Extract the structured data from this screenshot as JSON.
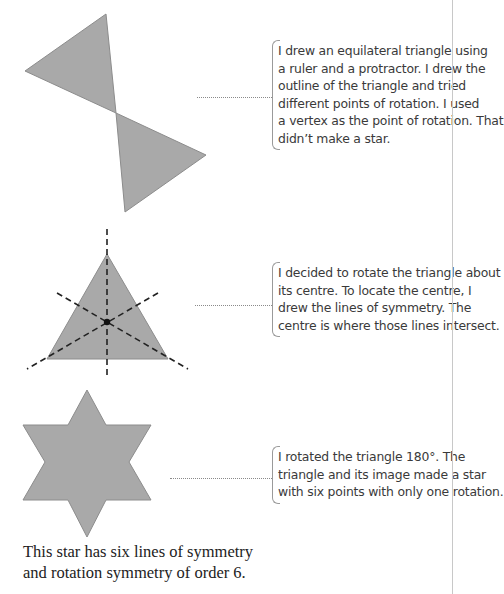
{
  "colors": {
    "shape_fill": "#a9a9a9",
    "shape_stroke": "#8c8c8c",
    "dash_line": "#222222",
    "connector": "#8a8a8a",
    "text": "#3a3a3a"
  },
  "figures": [
    {
      "id": "bowtie",
      "description": "Two equilateral triangles rotated about a shared vertex",
      "callout": {
        "lines": [
          "I drew an equilateral triangle using",
          "a ruler and a protractor. I drew the",
          "outline of the triangle and tried",
          "different points of rotation. I used",
          "a vertex as the point of rotation. That",
          "didn’t make a star."
        ]
      }
    },
    {
      "id": "triangle-symmetry",
      "description": "Equilateral triangle with three dashed lines of symmetry meeting at the centre",
      "callout": {
        "lines": [
          "I decided to rotate the triangle about",
          "its centre. To locate the centre, I",
          "drew the lines of symmetry. The",
          "centre is where those lines intersect."
        ]
      }
    },
    {
      "id": "six-point-star",
      "description": "Six-pointed star formed by triangle and its 180° rotation image",
      "callout": {
        "lines": [
          "I rotated the triangle 180°. The",
          "triangle and its image made a star",
          "with six points with only one rotation."
        ]
      }
    }
  ],
  "caption": {
    "lines": [
      "This star has six lines of symmetry",
      "and rotation symmetry of order 6."
    ]
  }
}
